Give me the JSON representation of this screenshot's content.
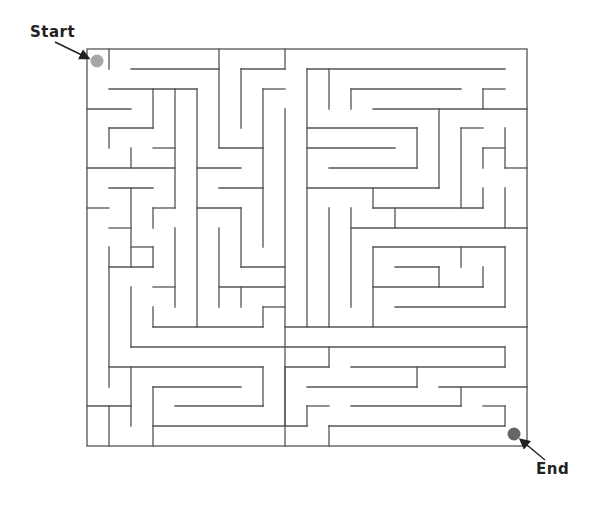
{
  "labels": {
    "start": "Start",
    "end": "End"
  },
  "markers": {
    "start": {
      "cx": 97,
      "cy": 61,
      "r": 6.5,
      "color": "#a6a6a6"
    },
    "end": {
      "cx": 514,
      "cy": 434,
      "r": 6.5,
      "color": "#666666"
    }
  },
  "colors": {
    "wall": "#555555",
    "arrow": "#222222",
    "background": "#ffffff"
  },
  "maze": {
    "border": {
      "x1": 87,
      "y1": 49,
      "x2": 527,
      "y2": 446
    },
    "start_opening": "top-left corner",
    "end_opening": "bottom-right corner",
    "walls": [
      [
        109,
        49,
        109,
        69
      ],
      [
        285,
        49,
        285,
        69
      ],
      [
        131,
        69,
        219,
        69
      ],
      [
        241,
        69,
        285,
        69
      ],
      [
        307,
        69,
        505,
        69
      ],
      [
        219,
        49,
        219,
        148
      ],
      [
        241,
        69,
        241,
        128
      ],
      [
        307,
        69,
        307,
        327
      ],
      [
        329,
        69,
        329,
        109
      ],
      [
        109,
        89,
        197,
        89
      ],
      [
        263,
        89,
        285,
        89
      ],
      [
        351,
        89,
        461,
        89
      ],
      [
        483,
        89,
        505,
        89
      ],
      [
        153,
        89,
        153,
        128
      ],
      [
        175,
        89,
        175,
        208
      ],
      [
        197,
        89,
        197,
        327
      ],
      [
        263,
        89,
        263,
        247
      ],
      [
        351,
        89,
        351,
        109
      ],
      [
        483,
        89,
        483,
        109
      ],
      [
        87,
        109,
        131,
        109
      ],
      [
        373,
        109,
        527,
        109
      ],
      [
        439,
        109,
        439,
        188
      ],
      [
        109,
        128,
        153,
        128
      ],
      [
        307,
        128,
        417,
        128
      ],
      [
        417,
        128,
        417,
        168
      ],
      [
        461,
        128,
        483,
        128
      ],
      [
        461,
        128,
        461,
        208
      ],
      [
        505,
        128,
        505,
        168
      ],
      [
        109,
        128,
        109,
        148
      ],
      [
        285,
        109,
        285,
        446
      ],
      [
        153,
        148,
        175,
        148
      ],
      [
        219,
        148,
        263,
        148
      ],
      [
        307,
        148,
        395,
        148
      ],
      [
        483,
        148,
        483,
        168
      ],
      [
        131,
        148,
        131,
        168
      ],
      [
        483,
        148,
        505,
        148
      ],
      [
        87,
        168,
        175,
        168
      ],
      [
        197,
        168,
        241,
        168
      ],
      [
        329,
        168,
        417,
        168
      ],
      [
        505,
        168,
        527,
        168
      ],
      [
        109,
        188,
        153,
        188
      ],
      [
        219,
        188,
        263,
        188
      ],
      [
        307,
        188,
        439,
        188
      ],
      [
        373,
        188,
        373,
        208
      ],
      [
        483,
        188,
        483,
        208
      ],
      [
        505,
        188,
        505,
        228
      ],
      [
        87,
        208,
        109,
        208
      ],
      [
        153,
        208,
        175,
        208
      ],
      [
        153,
        208,
        153,
        228
      ],
      [
        197,
        208,
        241,
        208
      ],
      [
        241,
        208,
        241,
        267
      ],
      [
        373,
        208,
        483,
        208
      ],
      [
        395,
        208,
        395,
        228
      ],
      [
        329,
        208,
        329,
        327
      ],
      [
        351,
        208,
        351,
        307
      ],
      [
        109,
        228,
        131,
        228
      ],
      [
        175,
        228,
        175,
        307
      ],
      [
        219,
        228,
        219,
        307
      ],
      [
        351,
        228,
        527,
        228
      ],
      [
        109,
        247,
        109,
        387
      ],
      [
        131,
        188,
        131,
        267
      ],
      [
        131,
        247,
        153,
        247
      ],
      [
        153,
        247,
        153,
        267
      ],
      [
        373,
        247,
        505,
        247
      ],
      [
        505,
        247,
        505,
        307
      ],
      [
        461,
        247,
        461,
        267
      ],
      [
        109,
        267,
        153,
        267
      ],
      [
        241,
        267,
        285,
        267
      ],
      [
        395,
        267,
        439,
        267
      ],
      [
        439,
        267,
        439,
        287
      ],
      [
        483,
        267,
        483,
        287
      ],
      [
        153,
        287,
        175,
        287
      ],
      [
        131,
        287,
        131,
        347
      ],
      [
        219,
        287,
        285,
        287
      ],
      [
        241,
        287,
        241,
        307
      ],
      [
        373,
        247,
        373,
        327
      ],
      [
        373,
        287,
        483,
        287
      ],
      [
        153,
        307,
        153,
        327
      ],
      [
        263,
        307,
        285,
        307
      ],
      [
        263,
        307,
        263,
        327
      ],
      [
        395,
        307,
        505,
        307
      ],
      [
        153,
        327,
        263,
        327
      ],
      [
        285,
        327,
        527,
        327
      ],
      [
        131,
        347,
        505,
        347
      ],
      [
        505,
        347,
        505,
        367
      ],
      [
        329,
        347,
        329,
        367
      ],
      [
        109,
        367,
        263,
        367
      ],
      [
        263,
        367,
        263,
        406
      ],
      [
        285,
        367,
        329,
        367
      ],
      [
        351,
        367,
        505,
        367
      ],
      [
        417,
        367,
        417,
        387
      ],
      [
        285,
        367,
        285,
        426
      ],
      [
        131,
        367,
        131,
        426
      ],
      [
        153,
        387,
        241,
        387
      ],
      [
        153,
        387,
        153,
        446
      ],
      [
        307,
        387,
        417,
        387
      ],
      [
        439,
        387,
        527,
        387
      ],
      [
        461,
        387,
        461,
        406
      ],
      [
        87,
        406,
        131,
        406
      ],
      [
        175,
        406,
        263,
        406
      ],
      [
        307,
        406,
        329,
        406
      ],
      [
        351,
        406,
        461,
        406
      ],
      [
        483,
        406,
        505,
        406
      ],
      [
        505,
        406,
        505,
        426
      ],
      [
        307,
        406,
        307,
        426
      ],
      [
        109,
        406,
        109,
        446
      ],
      [
        153,
        426,
        307,
        426
      ],
      [
        329,
        426,
        505,
        426
      ],
      [
        329,
        426,
        329,
        446
      ]
    ]
  }
}
